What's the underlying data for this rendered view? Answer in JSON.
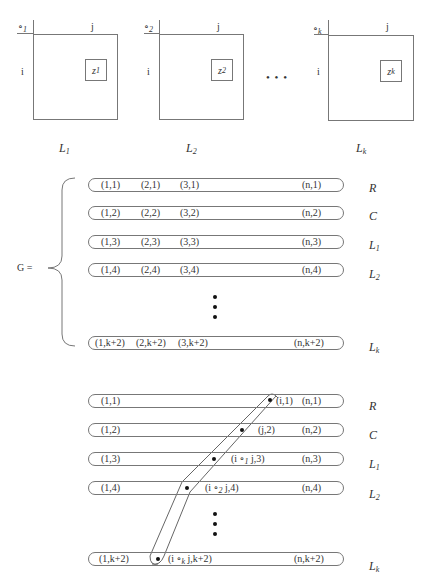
{
  "top_grids": [
    {
      "op": "∘",
      "op_sub": "1",
      "row_label": "i",
      "col_label": "j",
      "cell_var": "z",
      "cell_sub": "1",
      "caption": "L",
      "caption_sub": "1"
    },
    {
      "op": "∘",
      "op_sub": "2",
      "row_label": "i",
      "col_label": "j",
      "cell_var": "z",
      "cell_sub": "2",
      "caption": "L",
      "caption_sub": "2"
    },
    {
      "op": "∘",
      "op_sub": "k",
      "row_label": "i",
      "col_label": "j",
      "cell_var": "z",
      "cell_sub": "k",
      "caption": "L",
      "caption_sub": "k"
    }
  ],
  "ellipsis_h": "• • •",
  "middle": {
    "g_label": "G =",
    "rows": [
      {
        "cells": [
          "(1,1)",
          "(2,1)",
          "(3,1)"
        ],
        "last": "(n,1)",
        "label": "R",
        "label_sub": ""
      },
      {
        "cells": [
          "(1,2)",
          "(2,2)",
          "(3,2)"
        ],
        "last": "(n,2)",
        "label": "C",
        "label_sub": ""
      },
      {
        "cells": [
          "(1,3)",
          "(2,3)",
          "(3,3)"
        ],
        "last": "(n,3)",
        "label": "L",
        "label_sub": "1"
      },
      {
        "cells": [
          "(1,4)",
          "(2,4)",
          "(3,4)"
        ],
        "last": "(n,4)",
        "label": "L",
        "label_sub": "2"
      },
      {
        "cells": [
          "(1,k+2)",
          "(2,k+2)",
          "(3,k+2)"
        ],
        "last": "(n,k+2)",
        "label": "L",
        "label_sub": "k"
      }
    ]
  },
  "bottom": {
    "rows": [
      {
        "first": "(1,1)",
        "mid_pre": "(i,1)",
        "mid_op": "",
        "mid_post": "",
        "last": "(n,1)",
        "label": "R",
        "label_sub": ""
      },
      {
        "first": "(1,2)",
        "mid_pre": "(j,2)",
        "mid_op": "",
        "mid_post": "",
        "last": "(n,2)",
        "label": "C",
        "label_sub": ""
      },
      {
        "first": "(1,3)",
        "mid_pre": "(i ∘",
        "mid_op": "1",
        "mid_post": " j,3)",
        "last": "(n,3)",
        "label": "L",
        "label_sub": "1"
      },
      {
        "first": "(1,4)",
        "mid_pre": "(i ∘",
        "mid_op": "2",
        "mid_post": " j,4)",
        "last": "(n,4)",
        "label": "L",
        "label_sub": "2"
      },
      {
        "first": "(1,k+2)",
        "mid_pre": "(i ∘",
        "mid_op": "k",
        "mid_post": " j,k+2)",
        "last": "(n,k+2)",
        "label": "L",
        "label_sub": "k"
      }
    ]
  }
}
